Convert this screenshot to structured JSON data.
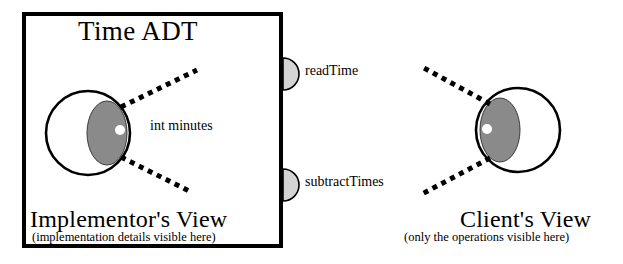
{
  "diagram": {
    "title": "Time ADT",
    "module_box": {
      "x": 22,
      "y": 12,
      "width": 261,
      "height": 236,
      "border_color": "#000000",
      "border_width": 4,
      "fill": "#ffffff"
    },
    "left_panel": {
      "heading": "Implementor's View",
      "subheading": "(implementation details visible here)",
      "internal_field_label": "int minutes",
      "eye": {
        "name": "implementor-eye",
        "cx": 88,
        "cy": 133,
        "r": 42,
        "iris_cx": 107,
        "iris_cy": 133,
        "iris_rx": 20,
        "iris_ry": 32,
        "pupil_cx": 120,
        "pupil_cy": 130,
        "pupil_r": 5,
        "outline_color": "#000000",
        "iris_color": "#8a8a8a",
        "pupil_color": "#ffffff",
        "sclera_color": "#ffffff",
        "looking": "right"
      }
    },
    "right_panel": {
      "heading": "Client's View",
      "subheading": "(only the operations visible here)",
      "eye": {
        "name": "client-eye",
        "cx": 518,
        "cy": 130,
        "r": 42,
        "iris_cx": 500,
        "iris_cy": 130,
        "iris_rx": 20,
        "iris_ry": 32,
        "pupil_cx": 487,
        "pupil_cy": 129,
        "pupil_r": 5,
        "outline_color": "#000000",
        "iris_color": "#8a8a8a",
        "pupil_color": "#ffffff",
        "sclera_color": "#ffffff",
        "looking": "left"
      }
    },
    "operations": [
      {
        "name": "readTime",
        "label": "readTime",
        "lollipop": {
          "cx": 283,
          "cy": 74,
          "r": 16,
          "fill": "#d4d4d4",
          "stroke": "#000000"
        }
      },
      {
        "name": "subtractTimes",
        "label": "subtractTimes",
        "lollipop": {
          "cx": 283,
          "cy": 185,
          "r": 16,
          "fill": "#d4d4d4",
          "stroke": "#000000"
        }
      }
    ],
    "sight_lines": [
      {
        "name": "implementor-upper-sightline",
        "x1": 121,
        "y1": 107,
        "x2": 197,
        "y2": 70
      },
      {
        "name": "implementor-lower-sightline",
        "x1": 121,
        "y1": 157,
        "x2": 191,
        "y2": 192
      },
      {
        "name": "client-upper-sightline",
        "x1": 490,
        "y1": 104,
        "x2": 424,
        "y2": 68
      },
      {
        "name": "client-lower-sightline",
        "x1": 490,
        "y1": 158,
        "x2": 422,
        "y2": 194
      }
    ],
    "colors": {
      "ink": "#000000",
      "iris_gray": "#8a8a8a",
      "lollipop_gray": "#d4d4d4",
      "background": "#ffffff"
    }
  }
}
